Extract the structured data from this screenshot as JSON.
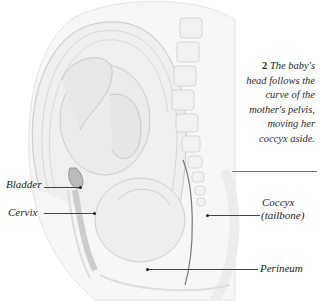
{
  "figure": {
    "caption_number": "2",
    "caption_text": "The baby's head follows the curve of the mother's pelvis, moving her coccyx aside.",
    "caption_lines": [
      "The baby's",
      "head follows the",
      "curve of the",
      "mother's pelvis,",
      "moving her",
      "coccyx aside."
    ]
  },
  "labels": {
    "bladder": "Bladder",
    "cervix": "Cervix",
    "coccyx_line1": "Coccyx",
    "coccyx_line2": "(tailbone)",
    "perineum": "Perineum"
  },
  "colors": {
    "background": "#ffffff",
    "tissue": "#e9e9e9",
    "outline": "#c8c8c8",
    "text": "#222222",
    "leader": "#444444"
  }
}
